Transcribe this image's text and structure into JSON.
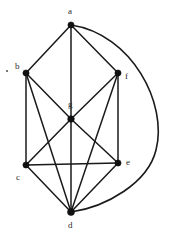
{
  "figure": {
    "background_color": "#ffffff",
    "edge_color": "#1a1a1a",
    "vertex_color": "#111111",
    "label_color": "#2a2a2a"
  },
  "graph": {
    "vertices": [
      {
        "id": "a",
        "label": "a",
        "x": 71,
        "y": 25,
        "label_x": 68,
        "label_y": 7,
        "radius": 3.1
      },
      {
        "id": "b",
        "label": "b",
        "x": 26,
        "y": 73,
        "label_x": 15,
        "label_y": 62,
        "radius": 3.1
      },
      {
        "id": "f",
        "label": "f",
        "x": 118,
        "y": 73,
        "label_x": 125,
        "label_y": 72,
        "radius": 3.1
      },
      {
        "id": "g",
        "label": "g",
        "x": 71,
        "y": 119,
        "label_x": 68,
        "label_y": 100,
        "radius": 3.3
      },
      {
        "id": "c",
        "label": "c",
        "x": 26,
        "y": 165,
        "label_x": 16,
        "label_y": 173,
        "radius": 3.1
      },
      {
        "id": "e",
        "label": "e",
        "x": 118,
        "y": 163,
        "label_x": 126,
        "label_y": 158,
        "radius": 3.1
      },
      {
        "id": "d",
        "label": "d",
        "x": 71,
        "y": 212,
        "label_x": 68,
        "label_y": 221,
        "radius": 3.5
      }
    ],
    "edges": [
      {
        "from": "a",
        "to": "b",
        "kind": "straight"
      },
      {
        "from": "a",
        "to": "f",
        "kind": "straight"
      },
      {
        "from": "a",
        "to": "g",
        "kind": "straight"
      },
      {
        "from": "g",
        "to": "d",
        "kind": "straight"
      },
      {
        "from": "a",
        "to": "d",
        "kind": "curved",
        "note": "outer arc sweeping right"
      },
      {
        "from": "b",
        "to": "c",
        "kind": "straight"
      },
      {
        "from": "b",
        "to": "g",
        "kind": "straight"
      },
      {
        "from": "b",
        "to": "d",
        "kind": "straight"
      },
      {
        "from": "c",
        "to": "g",
        "kind": "straight"
      },
      {
        "from": "c",
        "to": "e",
        "kind": "straight"
      },
      {
        "from": "c",
        "to": "d",
        "kind": "straight"
      },
      {
        "from": "g",
        "to": "f",
        "kind": "straight"
      },
      {
        "from": "g",
        "to": "e",
        "kind": "straight"
      },
      {
        "from": "f",
        "to": "e",
        "kind": "straight"
      },
      {
        "from": "f",
        "to": "d",
        "kind": "straight"
      },
      {
        "from": "e",
        "to": "d",
        "kind": "straight"
      }
    ],
    "curved_edge_path": "M 71 25 C 132 34, 168 104, 156 150 C 148 183, 106 207, 71 212",
    "stray_mark": {
      "x": 6,
      "y": 70
    }
  }
}
